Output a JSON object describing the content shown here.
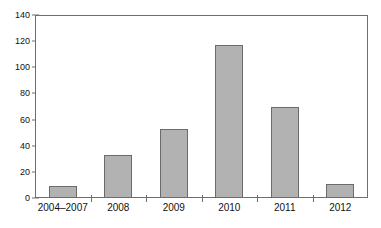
{
  "chart_data": {
    "type": "bar",
    "title": "",
    "subtitle": "",
    "xlabel": "",
    "ylabel": "",
    "categories": [
      "2004–2007",
      "2008",
      "2009",
      "2010",
      "2011",
      "2012"
    ],
    "values": [
      9,
      33,
      53,
      117,
      70,
      11
    ],
    "series": [
      {
        "name": "",
        "values": [
          9,
          33,
          53,
          117,
          70,
          11
        ]
      }
    ],
    "ylim": [
      0,
      140
    ],
    "ytick_step": 20,
    "ytick_labels": [
      "0",
      "20",
      "40",
      "60",
      "80",
      "100",
      "120",
      "140"
    ],
    "ytick_values": [
      0,
      20,
      40,
      60,
      80,
      100,
      120,
      140
    ],
    "grid": false,
    "legend": false,
    "legend_position": "none",
    "annotations": [],
    "bar_color": "#b2b2b2",
    "bar_border_color": "#6b6b6b",
    "axis_color": "#6e6e6e",
    "text_color": "#111111",
    "background_color": "#ffffff"
  }
}
